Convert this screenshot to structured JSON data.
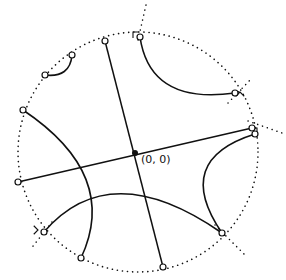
{
  "diagram": {
    "type": "hyperbolic-disk-geodesics",
    "origin_label": "(0, 0)",
    "colors": {
      "stroke": "#111111",
      "background": "#ffffff"
    },
    "boundary_circle": {
      "style": "dotted",
      "cx": 138,
      "cy": 152,
      "r": 120
    },
    "origin_point": {
      "x": 135,
      "y": 153
    },
    "diameters": [
      {
        "name": "diameter-steep",
        "x1": 105,
        "y1": 41,
        "x2": 163,
        "y2": 267
      },
      {
        "name": "diameter-shallow",
        "x1": 18,
        "y1": 182,
        "x2": 252,
        "y2": 128
      }
    ],
    "arcs": [
      {
        "name": "arc-top-left-small",
        "d": "M72,55 Q70,78 45,75"
      },
      {
        "name": "arc-top-right",
        "d": "M140,37 Q150,105 235,93"
      },
      {
        "name": "arc-left-large",
        "d": "M23,110 Q120,175 81,258"
      },
      {
        "name": "arc-bottom",
        "d": "M44,232 Q110,155 222,233"
      },
      {
        "name": "arc-right",
        "d": "M255,134 Q172,160 222,233"
      }
    ],
    "endpoints": [
      {
        "x": 105,
        "y": 41
      },
      {
        "x": 140,
        "y": 37
      },
      {
        "x": 72,
        "y": 55
      },
      {
        "x": 45,
        "y": 75
      },
      {
        "x": 23,
        "y": 110
      },
      {
        "x": 18,
        "y": 182
      },
      {
        "x": 44,
        "y": 232
      },
      {
        "x": 81,
        "y": 258
      },
      {
        "x": 163,
        "y": 267
      },
      {
        "x": 222,
        "y": 233
      },
      {
        "x": 235,
        "y": 93
      },
      {
        "x": 252,
        "y": 128
      },
      {
        "x": 255,
        "y": 134
      }
    ],
    "right_angle_markers": [
      {
        "x": 133,
        "y": 32,
        "rot": 0
      },
      {
        "x": 240,
        "y": 92,
        "rot": 45
      },
      {
        "x": 38,
        "y": 230,
        "rot": 135
      },
      {
        "x": 257,
        "y": 128,
        "rot": 90
      }
    ],
    "tangent_lines": [
      {
        "x1": 138,
        "y1": 40,
        "x2": 146,
        "y2": 5
      },
      {
        "x1": 228,
        "y1": 103,
        "x2": 252,
        "y2": 78
      },
      {
        "x1": 215,
        "y1": 225,
        "x2": 245,
        "y2": 255
      },
      {
        "x1": 52,
        "y1": 222,
        "x2": 30,
        "y2": 250
      },
      {
        "x1": 248,
        "y1": 121,
        "x2": 282,
        "y2": 133
      }
    ]
  }
}
